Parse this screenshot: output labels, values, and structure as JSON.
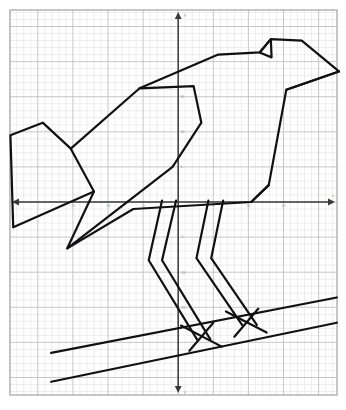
{
  "figure": {
    "kind": "coordinate-plane-picture",
    "background_color": "#ffffff",
    "frame": {
      "x": 10,
      "y": 10,
      "width": 327,
      "height": 385,
      "border_color": "#9a9a9a",
      "minor_grid_color": "#e2e2e6",
      "major_grid_color": "#bdbdc4",
      "minor_step_px": 7.02,
      "major_every": 5
    },
    "axes": {
      "line_color": "#3a3a3a",
      "origin_px": {
        "x": 178.2,
        "y": 202.0
      },
      "unit_px": 7.02,
      "x_axis": {
        "label": "x",
        "arrow_left": true,
        "arrow_right": true,
        "range": [
          -24,
          23
        ],
        "tick_labels": [
          "-15",
          "-10",
          "-5",
          "5",
          "10",
          "15"
        ],
        "tick_values": [
          -15,
          -10,
          -5,
          5,
          10,
          15
        ]
      },
      "y_axis": {
        "label": "y",
        "arrow_up": true,
        "arrow_down": true,
        "range": [
          -28,
          27
        ],
        "tick_labels": [
          "15",
          "10",
          "5",
          "-5",
          "-10",
          "-15"
        ],
        "tick_values": [
          15,
          10,
          5,
          -5,
          -10,
          -15
        ]
      }
    }
  },
  "chart_data": {
    "type": "scatter",
    "title": "",
    "subtitle": "",
    "xlabel": "x",
    "ylabel": "y",
    "xlim": [
      -24,
      23
    ],
    "ylim": [
      -28,
      27
    ],
    "grid": true,
    "legend_position": "none",
    "stroke_color": "#111111",
    "stroke_width_px": 2.2,
    "series": [
      {
        "name": "bird-tail",
        "type": "polyline",
        "closed": false,
        "values": [
          [
            -23.9,
            9.5
          ],
          [
            -19.3,
            11.3
          ],
          [
            -15.3,
            7.6
          ],
          [
            -12.0,
            1.5
          ],
          [
            -23.5,
            -3.6
          ],
          [
            -23.9,
            9.5
          ]
        ]
      },
      {
        "name": "bird-wing-and-back",
        "type": "polyline",
        "closed": false,
        "values": [
          [
            -15.3,
            7.6
          ],
          [
            -5.5,
            16.2
          ],
          [
            2.2,
            16.5
          ],
          [
            3.3,
            11.3
          ],
          [
            -0.8,
            5.0
          ],
          [
            -15.8,
            -6.6
          ],
          [
            -12.0,
            1.5
          ]
        ]
      },
      {
        "name": "bird-lower-body",
        "type": "polyline",
        "closed": false,
        "values": [
          [
            -15.8,
            -6.6
          ],
          [
            -6.4,
            -1.0
          ],
          [
            10.4,
            0.0
          ],
          [
            12.9,
            2.4
          ]
        ]
      },
      {
        "name": "bird-head-and-back-outline",
        "type": "polyline",
        "closed": false,
        "values": [
          [
            -5.5,
            16.2
          ],
          [
            5.7,
            21.0
          ],
          [
            11.6,
            21.3
          ],
          [
            13.2,
            23.2
          ],
          [
            17.6,
            23.0
          ],
          [
            22.9,
            18.6
          ],
          [
            15.4,
            16.0
          ],
          [
            12.9,
            2.4
          ],
          [
            10.4,
            0.0
          ]
        ]
      },
      {
        "name": "bird-beak-lower",
        "type": "polyline",
        "closed": false,
        "values": [
          [
            22.9,
            18.6
          ],
          [
            15.4,
            16.0
          ]
        ]
      },
      {
        "name": "bird-eye",
        "type": "polygon",
        "closed": true,
        "values": [
          [
            11.6,
            21.3
          ],
          [
            13.2,
            23.2
          ],
          [
            13.3,
            20.6
          ],
          [
            11.6,
            21.3
          ]
        ]
      },
      {
        "name": "leg-left-outer",
        "type": "polyline",
        "closed": false,
        "values": [
          [
            -2.3,
            0.2
          ],
          [
            -4.2,
            -8.3
          ],
          [
            2.7,
            -19.6
          ]
        ]
      },
      {
        "name": "leg-left-inner",
        "type": "polyline",
        "closed": false,
        "values": [
          [
            -0.3,
            0.2
          ],
          [
            -2.3,
            -8.3
          ],
          [
            4.6,
            -19.6
          ]
        ]
      },
      {
        "name": "leg-right-outer",
        "type": "polyline",
        "closed": false,
        "values": [
          [
            4.3,
            0.2
          ],
          [
            2.6,
            -8.0
          ],
          [
            9.1,
            -17.5
          ]
        ]
      },
      {
        "name": "leg-right-inner",
        "type": "polyline",
        "closed": false,
        "values": [
          [
            6.4,
            0.2
          ],
          [
            4.7,
            -8.0
          ],
          [
            11.2,
            -17.5
          ]
        ]
      },
      {
        "name": "foot-left-toes",
        "type": "polyline",
        "closed": false,
        "values": [
          [
            0.4,
            -17.6
          ],
          [
            6.2,
            -20.6
          ]
        ]
      },
      {
        "name": "foot-left-toe-back",
        "type": "polyline",
        "closed": false,
        "values": [
          [
            1.6,
            -21.2
          ],
          [
            5.0,
            -17.2
          ]
        ]
      },
      {
        "name": "foot-right-toes",
        "type": "polyline",
        "closed": false,
        "values": [
          [
            6.8,
            -15.6
          ],
          [
            12.6,
            -18.6
          ]
        ]
      },
      {
        "name": "foot-right-toe-back",
        "type": "polyline",
        "closed": false,
        "values": [
          [
            8.0,
            -19.2
          ],
          [
            11.4,
            -15.2
          ]
        ]
      },
      {
        "name": "branch-upper-edge",
        "type": "polyline",
        "closed": false,
        "values": [
          [
            -18.1,
            -21.5
          ],
          [
            22.6,
            -13.6
          ]
        ]
      },
      {
        "name": "branch-lower-edge",
        "type": "polyline",
        "closed": false,
        "values": [
          [
            -18.1,
            -25.6
          ],
          [
            22.6,
            -17.2
          ]
        ]
      }
    ]
  }
}
